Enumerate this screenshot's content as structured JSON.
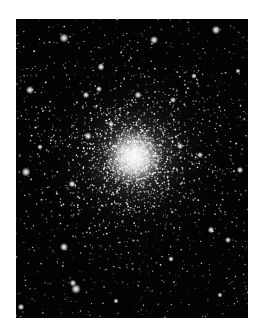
{
  "image": {
    "subject": "Globular star cluster",
    "alt": "Photograph of a dense globular star cluster against a black sky",
    "frame": {
      "left": 16,
      "top": 19,
      "width": 232,
      "height": 299
    },
    "colors": {
      "page_background": "#ffffff",
      "sky": "#030303",
      "star": "#ffffff",
      "core_glow": "#f4f4f4"
    },
    "core": {
      "x": 118,
      "y": 138,
      "radius_inner": 18,
      "radius_halo": 95
    },
    "star_counts": {
      "field": 900,
      "cluster": 2600
    },
    "bright_stars": [
      {
        "x": 48,
        "y": 19,
        "r": 1.8
      },
      {
        "x": 138,
        "y": 21,
        "r": 1.6
      },
      {
        "x": 200,
        "y": 11,
        "r": 1.7
      },
      {
        "x": 85,
        "y": 48,
        "r": 1.4
      },
      {
        "x": 14,
        "y": 71,
        "r": 1.6
      },
      {
        "x": 83,
        "y": 70,
        "r": 1.2
      },
      {
        "x": 70,
        "y": 76,
        "r": 1.3
      },
      {
        "x": 72,
        "y": 117,
        "r": 1.5
      },
      {
        "x": 10,
        "y": 153,
        "r": 1.8
      },
      {
        "x": 56,
        "y": 165,
        "r": 1.4
      },
      {
        "x": 48,
        "y": 228,
        "r": 1.6
      },
      {
        "x": 60,
        "y": 270,
        "r": 1.9
      },
      {
        "x": 57,
        "y": 264,
        "r": 1.3
      },
      {
        "x": 5,
        "y": 288,
        "r": 1.3
      },
      {
        "x": 164,
        "y": 127,
        "r": 1.3
      },
      {
        "x": 184,
        "y": 136,
        "r": 1.2
      },
      {
        "x": 195,
        "y": 211,
        "r": 1.3
      },
      {
        "x": 212,
        "y": 221,
        "r": 1.2
      },
      {
        "x": 224,
        "y": 151,
        "r": 1.3
      },
      {
        "x": 157,
        "y": 81,
        "r": 1.2
      },
      {
        "x": 122,
        "y": 76,
        "r": 1.4
      },
      {
        "x": 95,
        "y": 105,
        "r": 1.2
      },
      {
        "x": 178,
        "y": 57,
        "r": 1.1
      },
      {
        "x": 222,
        "y": 52,
        "r": 1.0
      },
      {
        "x": 24,
        "y": 128,
        "r": 1.1
      },
      {
        "x": 155,
        "y": 240,
        "r": 1.1
      },
      {
        "x": 204,
        "y": 276,
        "r": 1.0
      },
      {
        "x": 100,
        "y": 282,
        "r": 1.0
      }
    ]
  }
}
